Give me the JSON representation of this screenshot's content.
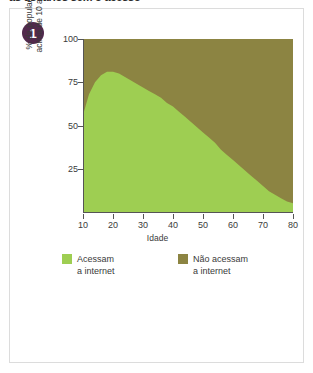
{
  "headline": "as usuários sem o acesso",
  "card": {
    "badge": "1"
  },
  "chart_data": {
    "type": "area",
    "title": "",
    "subtitle": "",
    "xlabel": "Idade",
    "ylabel": "% da população",
    "ylabel_line2": "acima de 10 anos",
    "xlim": [
      10,
      80
    ],
    "ylim": [
      0,
      100
    ],
    "xticks": [
      10,
      20,
      30,
      40,
      50,
      60,
      70,
      80
    ],
    "yticks": [
      25,
      50,
      75,
      100
    ],
    "grid": false,
    "legend_position": "bottom",
    "stacked": true,
    "total": 100,
    "x": [
      10,
      12,
      14,
      16,
      18,
      20,
      22,
      24,
      26,
      28,
      30,
      32,
      34,
      36,
      38,
      40,
      42,
      44,
      46,
      48,
      50,
      52,
      54,
      56,
      58,
      60,
      62,
      64,
      66,
      68,
      70,
      72,
      74,
      76,
      78,
      80
    ],
    "series": [
      {
        "name": "Acessam a internet",
        "color": "#9ece52",
        "values": [
          56,
          68,
          75,
          79,
          81,
          81,
          80,
          78,
          76,
          74,
          72,
          70,
          68,
          66,
          63,
          61,
          58,
          55,
          52,
          49,
          46,
          43,
          40,
          36,
          33,
          30,
          27,
          24,
          21,
          18,
          15,
          12,
          10,
          8,
          6,
          5
        ]
      },
      {
        "name": "Não acessam a internet",
        "color": "#8c8442",
        "values": [
          44,
          32,
          25,
          21,
          19,
          19,
          20,
          22,
          24,
          26,
          28,
          30,
          32,
          34,
          37,
          39,
          42,
          45,
          48,
          51,
          54,
          57,
          60,
          64,
          67,
          70,
          73,
          76,
          79,
          82,
          85,
          88,
          90,
          92,
          94,
          95
        ]
      }
    ]
  },
  "legend": [
    {
      "label_line1": "Acessam",
      "label_line2": "a internet",
      "color": "#9ece52"
    },
    {
      "label_line1": "Não acessam",
      "label_line2": "a internet",
      "color": "#8c8442"
    }
  ]
}
